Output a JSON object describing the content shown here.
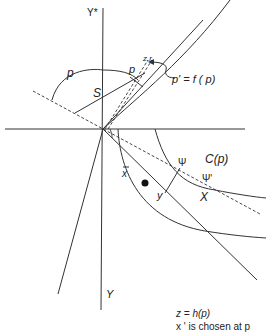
{
  "diagram": {
    "axes": {
      "y_star_label": "Y*",
      "y_label": "Y"
    },
    "labels": {
      "p_arc": "p",
      "p_point": "p",
      "S": "S",
      "z_prime": "z,r",
      "p_prime_eq": "p' = f ( p)",
      "x_bar": "x",
      "y": "y",
      "psi": "Ψ",
      "psi_prime": "Ψ'",
      "C_p": "C(p)",
      "X": "X"
    },
    "caption": {
      "line1": "z = h(p)",
      "line2": "x ' is chosen at p"
    },
    "colors": {
      "line": "#333333",
      "background": "#ffffff"
    }
  }
}
